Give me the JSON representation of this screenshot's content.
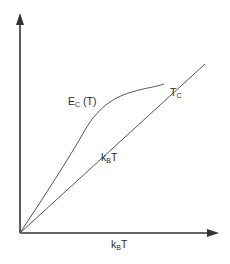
{
  "diagram": {
    "type": "energy-vs-temperature sketch",
    "labels": {
      "curve_main": "E",
      "curve_sub": "C",
      "curve_arg": " (T)",
      "line_main": "k",
      "line_sub": "B",
      "line_tail": "T",
      "tc_main": "T",
      "tc_sub": "C",
      "xaxis_main": "k",
      "xaxis_sub": "B",
      "xaxis_tail": "T"
    },
    "colors": {
      "axis": "#333333",
      "line": "#555555",
      "text": "#2a2a2a"
    },
    "geometry": {
      "origin": [
        20,
        233
      ],
      "x_axis_end": [
        218,
        233
      ],
      "y_axis_end": [
        20,
        14
      ],
      "line_end": [
        205,
        64
      ],
      "tc_point": [
        164,
        84
      ]
    }
  }
}
